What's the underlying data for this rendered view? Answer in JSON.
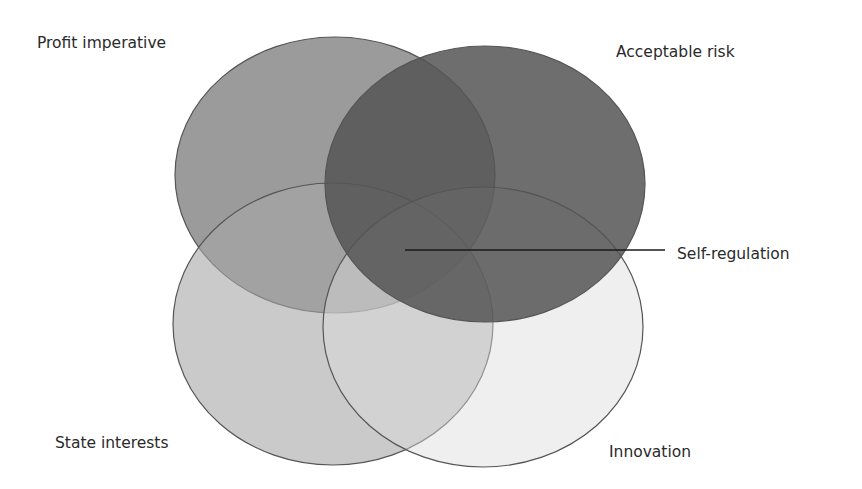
{
  "diagram": {
    "type": "venn",
    "sets": [
      {
        "id": "profit",
        "label": "Profit imperative",
        "fill": "#8a8a8a",
        "opacity": 0.85,
        "cx": 335,
        "cy": 175,
        "rx": 160,
        "ry": 138
      },
      {
        "id": "risk",
        "label": "Acceptable risk",
        "fill": "#555555",
        "opacity": 0.85,
        "cx": 485,
        "cy": 184,
        "rx": 160,
        "ry": 138
      },
      {
        "id": "state",
        "label": "State interests",
        "fill": "#a6a6a6",
        "opacity": 0.6,
        "cx": 333,
        "cy": 324,
        "rx": 160,
        "ry": 141
      },
      {
        "id": "innovation",
        "label": "Innovation",
        "fill": "#dcdcdc",
        "opacity": 0.45,
        "cx": 483,
        "cy": 327,
        "rx": 160,
        "ry": 140
      }
    ],
    "intersection_label": {
      "label": "Self-regulation",
      "line_from": [
        405,
        250
      ],
      "line_to": [
        665,
        250
      ]
    },
    "stroke_color": "#555555"
  },
  "labels": {
    "profit": "Profit imperative",
    "risk": "Acceptable risk",
    "self_regulation": "Self-regulation",
    "state": "State interests",
    "innovation": "Innovation"
  }
}
